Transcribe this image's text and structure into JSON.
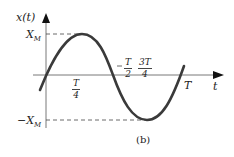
{
  "figure": {
    "y_axis_label": "x(t)",
    "x_axis_label": "t",
    "caption": "(b)",
    "labels": {
      "max": {
        "main": "X",
        "sub": "M"
      },
      "min": {
        "main": "−X",
        "sub": "M"
      },
      "period": "T",
      "quarter": {
        "num": "T",
        "den": "4"
      },
      "half": {
        "num": "T",
        "den": "2"
      },
      "three_quarter": {
        "num": "3T",
        "den": "4"
      }
    },
    "colors": {
      "curve": "#3a3a3a",
      "axis": "#555555",
      "arrow": "#111111"
    }
  }
}
